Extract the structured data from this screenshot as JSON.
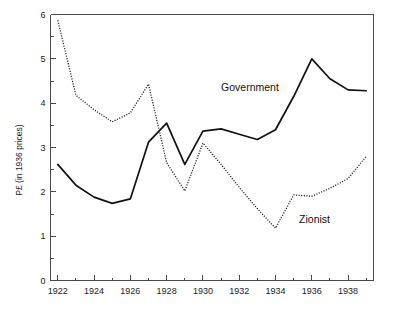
{
  "chart_data": {
    "type": "line",
    "title": "",
    "subtitle": "",
    "xlabel": "",
    "ylabel": "P£ (in 1936 prices)",
    "xlim": [
      1921.6,
      1939.4
    ],
    "ylim": [
      0,
      6
    ],
    "grid": false,
    "legend_position": "inline-annotations",
    "x": [
      1922,
      1923,
      1924,
      1925,
      1926,
      1927,
      1928,
      1929,
      1930,
      1931,
      1932,
      1933,
      1934,
      1935,
      1936,
      1937,
      1938,
      1939
    ],
    "xticks_major": [
      1922,
      1924,
      1926,
      1928,
      1930,
      1932,
      1934,
      1936,
      1938
    ],
    "xticks_major_labels": [
      "1922",
      "1924",
      "1926",
      "1928",
      "1930",
      "1932",
      "1934",
      "1936",
      "1938"
    ],
    "xticks_minor": [
      1923,
      1925,
      1927,
      1929,
      1931,
      1933,
      1935,
      1937,
      1939
    ],
    "yticks_major": [
      0,
      1,
      2,
      3,
      4,
      5,
      6
    ],
    "yticks_major_labels": [
      "0",
      "1",
      "2",
      "3",
      "4",
      "5",
      "6"
    ],
    "yticks_minor": [
      0.5,
      1.5,
      2.5,
      3.5,
      4.5,
      5.5
    ],
    "series": [
      {
        "name": "Government",
        "style": "solid",
        "color": "#111111",
        "annotation": "Government",
        "annotation_x": 1931.0,
        "annotation_y": 4.28,
        "values": [
          2.62,
          2.15,
          1.88,
          1.74,
          1.84,
          3.12,
          3.55,
          2.62,
          3.37,
          3.42,
          3.3,
          3.18,
          3.4,
          4.15,
          5.0,
          4.55,
          4.3,
          4.28
        ]
      },
      {
        "name": "Zionist",
        "style": "dotted",
        "color": "#1a1a1a",
        "annotation": "Zionist",
        "annotation_x": 1935.3,
        "annotation_y": 1.3,
        "values": [
          5.87,
          4.18,
          3.85,
          3.58,
          3.78,
          4.43,
          2.66,
          2.02,
          3.1,
          2.62,
          2.1,
          1.62,
          1.18,
          1.93,
          1.9,
          2.08,
          2.3,
          2.8
        ]
      }
    ]
  },
  "axes": {
    "y_axis_title": "P£ (in 1936 prices)"
  }
}
